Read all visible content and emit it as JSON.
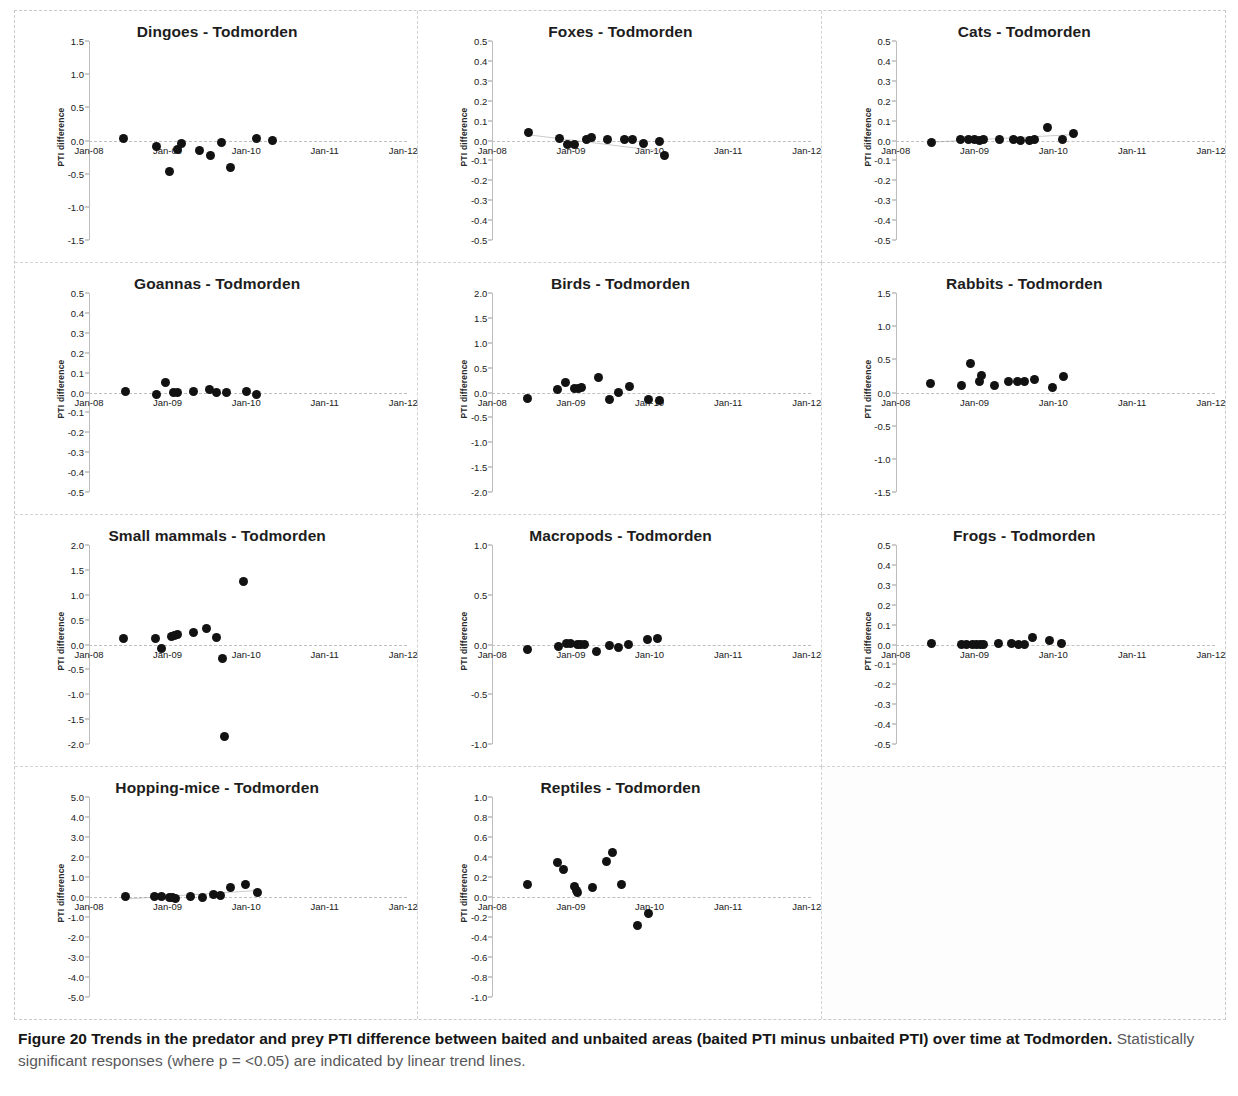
{
  "figure": {
    "caption_bold": "Figure 20 Trends in the predator and prey PTI difference between baited and unbaited areas (baited PTI minus unbaited PTI) over time at Todmorden.",
    "caption_rest": " Statistically significant responses (where p = <0.05) are indicated by linear trend lines.",
    "site": "Todmorden",
    "ylabel": "PTI difference",
    "xticks": [
      "Jan-08",
      "Jan-09",
      "Jan-10",
      "Jan-11",
      "Jan-12"
    ],
    "dot_color": "#121212",
    "trend_color": "#8a8a8a"
  },
  "chart_data": [
    {
      "type": "scatter",
      "title": "Dingoes - Todmorden",
      "xlabel": "",
      "ylabel": "PTI difference",
      "xticks": [
        "Jan-08",
        "Jan-09",
        "Jan-10",
        "Jan-11",
        "Jan-12"
      ],
      "yticks": [
        1.5,
        1.0,
        0.5,
        0.0,
        -0.5,
        -1.0,
        -1.5
      ],
      "ylim": [
        -1.5,
        1.5
      ],
      "xlim": [
        0,
        4
      ],
      "grid": false,
      "trendline": null,
      "x": [
        0.44,
        0.86,
        1.02,
        1.12,
        1.18,
        1.41,
        1.55,
        1.69,
        1.8,
        2.13,
        2.33
      ],
      "y": [
        0.03,
        -0.09,
        -0.46,
        -0.14,
        -0.04,
        -0.15,
        -0.22,
        -0.03,
        -0.4,
        0.03,
        0.0
      ]
    },
    {
      "type": "scatter",
      "title": "Foxes - Todmorden",
      "xlabel": "",
      "ylabel": "PTI difference",
      "xticks": [
        "Jan-08",
        "Jan-09",
        "Jan-10",
        "Jan-11",
        "Jan-12"
      ],
      "yticks": [
        0.5,
        0.4,
        0.3,
        0.2,
        0.1,
        0.0,
        -0.1,
        -0.2,
        -0.3,
        -0.4,
        -0.5
      ],
      "ylim": [
        -0.5,
        0.5
      ],
      "xlim": [
        0,
        4
      ],
      "grid": false,
      "trendline": {
        "x0": 0.48,
        "y0": 0.028,
        "x1": 2.12,
        "y1": -0.052
      },
      "x": [
        0.46,
        0.86,
        0.96,
        1.04,
        1.2,
        1.26,
        1.47,
        1.68,
        1.78,
        1.93,
        2.13,
        2.19
      ],
      "y": [
        0.04,
        0.008,
        -0.018,
        -0.022,
        0.005,
        0.013,
        0.005,
        0.006,
        0.003,
        -0.014,
        -0.005,
        -0.075
      ]
    },
    {
      "type": "scatter",
      "title": "Cats - Todmorden",
      "xlabel": "",
      "ylabel": "PTI difference",
      "xticks": [
        "Jan-08",
        "Jan-09",
        "Jan-10",
        "Jan-11",
        "Jan-12"
      ],
      "yticks": [
        0.5,
        0.4,
        0.3,
        0.2,
        0.1,
        0.0,
        -0.1,
        -0.2,
        -0.3,
        -0.4,
        -0.5
      ],
      "ylim": [
        -0.5,
        0.5
      ],
      "xlim": [
        0,
        4
      ],
      "grid": false,
      "trendline": {
        "x0": 0.46,
        "y0": -0.008,
        "x1": 2.26,
        "y1": 0.03
      },
      "x": [
        0.46,
        0.82,
        0.92,
        1.0,
        1.06,
        1.12,
        1.32,
        1.5,
        1.58,
        1.7,
        1.76,
        1.93,
        2.12,
        2.25
      ],
      "y": [
        -0.012,
        0.004,
        0.004,
        0.003,
        0.002,
        0.003,
        0.004,
        0.003,
        0.002,
        0.002,
        0.003,
        0.067,
        0.003,
        0.033
      ]
    },
    {
      "type": "scatter",
      "title": "Goannas - Todmorden",
      "xlabel": "",
      "ylabel": "PTI difference",
      "xticks": [
        "Jan-08",
        "Jan-09",
        "Jan-10",
        "Jan-11",
        "Jan-12"
      ],
      "yticks": [
        0.5,
        0.4,
        0.3,
        0.2,
        0.1,
        0.0,
        -0.1,
        -0.2,
        -0.3,
        -0.4,
        -0.5
      ],
      "ylim": [
        -0.5,
        0.5
      ],
      "xlim": [
        0,
        4
      ],
      "grid": false,
      "trendline": null,
      "x": [
        0.46,
        0.86,
        0.97,
        1.08,
        1.13,
        1.33,
        1.53,
        1.62,
        1.75,
        2.0,
        2.13
      ],
      "y": [
        0.003,
        -0.012,
        0.05,
        0.002,
        0.002,
        0.003,
        0.014,
        0.002,
        0.002,
        0.003,
        -0.01
      ]
    },
    {
      "type": "scatter",
      "title": "Birds - Todmorden",
      "xlabel": "",
      "ylabel": "PTI difference",
      "xticks": [
        "Jan-08",
        "Jan-09",
        "Jan-10",
        "Jan-11",
        "Jan-12"
      ],
      "yticks": [
        2.0,
        1.5,
        1.0,
        0.5,
        0.0,
        -0.5,
        -1.0,
        -1.5,
        -2.0
      ],
      "ylim": [
        -2.0,
        2.0
      ],
      "xlim": [
        0,
        4
      ],
      "grid": false,
      "trendline": null,
      "x": [
        0.45,
        0.83,
        0.93,
        1.05,
        1.1,
        1.14,
        1.35,
        1.49,
        1.6,
        1.74,
        1.99,
        2.13
      ],
      "y": [
        -0.12,
        0.07,
        0.2,
        0.08,
        0.09,
        0.11,
        0.3,
        -0.14,
        0.0,
        0.12,
        -0.14,
        -0.17
      ]
    },
    {
      "type": "scatter",
      "title": "Rabbits - Todmorden",
      "xlabel": "",
      "ylabel": "PTI difference",
      "xticks": [
        "Jan-08",
        "Jan-09",
        "Jan-10",
        "Jan-11",
        "Jan-12"
      ],
      "yticks": [
        1.5,
        1.0,
        0.5,
        0.0,
        -0.5,
        -1.0,
        -1.5
      ],
      "ylim": [
        -1.5,
        1.5
      ],
      "xlim": [
        0,
        4
      ],
      "grid": false,
      "trendline": null,
      "x": [
        0.44,
        0.83,
        0.95,
        1.06,
        1.09,
        1.26,
        1.43,
        1.54,
        1.63,
        1.76,
        1.99,
        2.13
      ],
      "y": [
        0.14,
        0.11,
        0.43,
        0.17,
        0.25,
        0.11,
        0.16,
        0.16,
        0.16,
        0.2,
        0.08,
        0.24
      ]
    },
    {
      "type": "scatter",
      "title": "Small mammals - Todmorden",
      "xlabel": "",
      "ylabel": "PTI difference",
      "xticks": [
        "Jan-08",
        "Jan-09",
        "Jan-10",
        "Jan-11",
        "Jan-12"
      ],
      "yticks": [
        2.0,
        1.5,
        1.0,
        0.5,
        0.0,
        -0.5,
        -1.0,
        -1.5,
        -2.0
      ],
      "ylim": [
        -2.0,
        2.0
      ],
      "xlim": [
        0,
        4
      ],
      "grid": false,
      "trendline": null,
      "x": [
        0.44,
        0.84,
        0.92,
        1.05,
        1.09,
        1.13,
        1.33,
        1.5,
        1.62,
        1.7,
        1.72,
        1.97
      ],
      "y": [
        0.12,
        0.13,
        -0.09,
        0.17,
        0.18,
        0.21,
        0.24,
        0.33,
        0.14,
        -0.29,
        -1.85,
        1.27
      ]
    },
    {
      "type": "scatter",
      "title": "Macropods - Todmorden",
      "xlabel": "",
      "ylabel": "PTI difference",
      "xticks": [
        "Jan-08",
        "Jan-09",
        "Jan-10",
        "Jan-11",
        "Jan-12"
      ],
      "yticks": [
        1.0,
        0.5,
        0.0,
        -0.5,
        -1.0
      ],
      "ylim": [
        -1.0,
        1.0
      ],
      "xlim": [
        0,
        4
      ],
      "grid": false,
      "trendline": null,
      "x": [
        0.45,
        0.84,
        0.94,
        1.0,
        1.08,
        1.12,
        1.17,
        1.33,
        1.49,
        1.6,
        1.73,
        1.98,
        2.1
      ],
      "y": [
        -0.055,
        -0.022,
        0.01,
        0.014,
        0.005,
        0.003,
        0.002,
        -0.075,
        -0.006,
        -0.03,
        -0.005,
        0.055,
        0.058
      ]
    },
    {
      "type": "scatter",
      "title": "Frogs - Todmorden",
      "xlabel": "",
      "ylabel": "PTI difference",
      "xticks": [
        "Jan-08",
        "Jan-09",
        "Jan-10",
        "Jan-11",
        "Jan-12"
      ],
      "yticks": [
        0.5,
        0.4,
        0.3,
        0.2,
        0.1,
        0.0,
        -0.1,
        -0.2,
        -0.3,
        -0.4,
        -0.5
      ],
      "ylim": [
        -0.5,
        0.5
      ],
      "xlim": [
        0,
        4
      ],
      "grid": false,
      "trendline": null,
      "x": [
        0.45,
        0.83,
        0.9,
        0.98,
        1.03,
        1.07,
        1.11,
        1.3,
        1.47,
        1.56,
        1.63,
        1.74,
        1.95,
        2.1
      ],
      "y": [
        0.004,
        0.002,
        0.002,
        0.002,
        0.002,
        0.002,
        0.002,
        0.003,
        0.006,
        0.002,
        0.002,
        0.036,
        0.022,
        0.003
      ]
    },
    {
      "type": "scatter",
      "title": "Hopping-mice - Todmorden",
      "xlabel": "",
      "ylabel": "PTI difference",
      "xticks": [
        "Jan-08",
        "Jan-09",
        "Jan-10",
        "Jan-11",
        "Jan-12"
      ],
      "yticks": [
        5.0,
        4.0,
        3.0,
        2.0,
        1.0,
        0.0,
        -1.0,
        -2.0,
        -3.0,
        -4.0,
        -5.0
      ],
      "ylim": [
        -5.0,
        5.0
      ],
      "xlim": [
        0,
        4
      ],
      "grid": false,
      "trendline": {
        "x0": 0.47,
        "y0": -0.1,
        "x1": 2.16,
        "y1": 0.33
      },
      "x": [
        0.46,
        0.83,
        0.92,
        1.02,
        1.06,
        1.1,
        1.29,
        1.45,
        1.58,
        1.67,
        1.8,
        1.99,
        2.14
      ],
      "y": [
        0.02,
        0.02,
        0.01,
        0.0,
        -0.02,
        -0.05,
        0.02,
        0.0,
        0.14,
        0.08,
        0.47,
        0.65,
        0.25
      ]
    },
    {
      "type": "scatter",
      "title": "Reptiles - Todmorden",
      "xlabel": "",
      "ylabel": "PTI difference",
      "xticks": [
        "Jan-08",
        "Jan-09",
        "Jan-10",
        "Jan-11",
        "Jan-12"
      ],
      "yticks": [
        1.0,
        0.8,
        0.6,
        0.4,
        0.2,
        0.0,
        -0.2,
        -0.4,
        -0.6,
        -0.8,
        -1.0
      ],
      "ylim": [
        -1.0,
        1.0
      ],
      "xlim": [
        0,
        4
      ],
      "grid": false,
      "trendline": null,
      "x": [
        0.45,
        0.83,
        0.91,
        1.05,
        1.07,
        1.09,
        1.27,
        1.45,
        1.53,
        1.64,
        1.85,
        1.99
      ],
      "y": [
        0.13,
        0.35,
        0.28,
        0.11,
        0.07,
        0.05,
        0.1,
        0.36,
        0.45,
        0.13,
        -0.28,
        -0.16
      ]
    }
  ]
}
